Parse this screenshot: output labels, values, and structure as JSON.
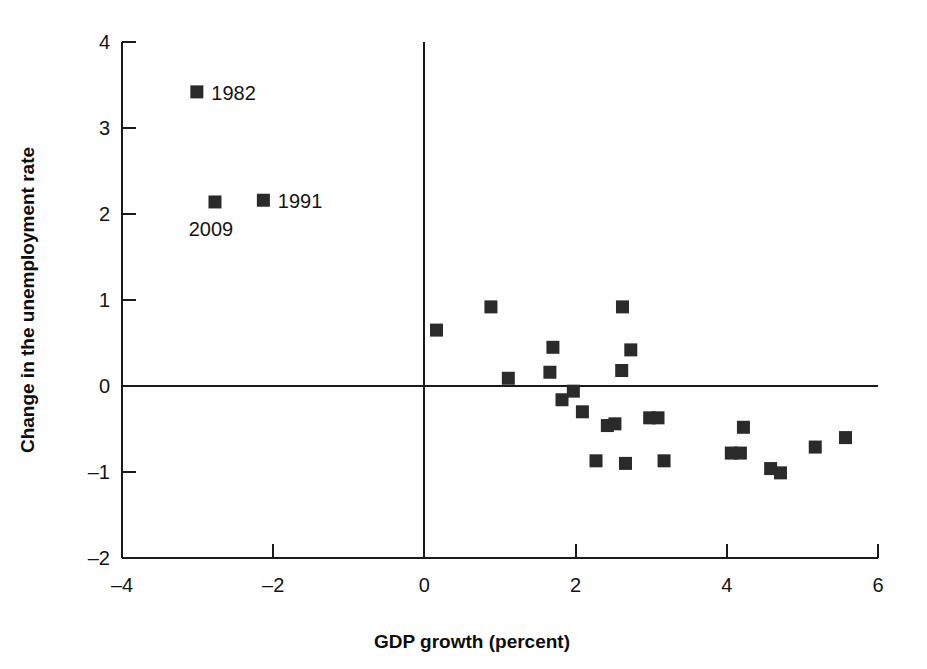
{
  "chart_data": {
    "type": "scatter",
    "title": "",
    "subtitle": "",
    "xlabel": "GDP growth (percent)",
    "ylabel": "Change in the unemployment rate",
    "xlim": [
      -4,
      6
    ],
    "ylim": [
      -2,
      4
    ],
    "xticks": [
      -4,
      -2,
      0,
      2,
      4,
      6
    ],
    "yticks": [
      -2,
      -1,
      0,
      1,
      2,
      3,
      4
    ],
    "xtick_labels": [
      "–4",
      "–2",
      "0",
      "2",
      "4",
      "6"
    ],
    "ytick_labels": [
      "–2",
      "–1",
      "0",
      "1",
      "2",
      "3",
      "4"
    ],
    "grid": false,
    "legend": "none",
    "zero_lines": {
      "x": true,
      "y": true
    },
    "marker": {
      "shape": "square",
      "color": "#2a2a2a",
      "size": 13
    },
    "annotations": [
      {
        "text": "1982",
        "x": -3.01,
        "y": 3.42,
        "placement": "right"
      },
      {
        "text": "2009",
        "x": -2.77,
        "y": 2.14,
        "placement": "below-left"
      },
      {
        "text": "1991",
        "x": -2.13,
        "y": 2.16,
        "placement": "right"
      }
    ],
    "points": [
      {
        "x": -3.01,
        "y": 3.42,
        "label": "1982"
      },
      {
        "x": -2.77,
        "y": 2.14,
        "label": "2009"
      },
      {
        "x": -2.13,
        "y": 2.16,
        "label": "1991"
      },
      {
        "x": 0.16,
        "y": 0.65,
        "label": ""
      },
      {
        "x": 0.88,
        "y": 0.92,
        "label": ""
      },
      {
        "x": 1.11,
        "y": 0.09,
        "label": ""
      },
      {
        "x": 1.7,
        "y": 0.45,
        "label": ""
      },
      {
        "x": 1.66,
        "y": 0.16,
        "label": ""
      },
      {
        "x": 1.82,
        "y": -0.16,
        "label": ""
      },
      {
        "x": 1.97,
        "y": -0.06,
        "label": ""
      },
      {
        "x": 2.09,
        "y": -0.3,
        "label": ""
      },
      {
        "x": 2.27,
        "y": -0.87,
        "label": ""
      },
      {
        "x": 2.42,
        "y": -0.46,
        "label": ""
      },
      {
        "x": 2.52,
        "y": -0.44,
        "label": ""
      },
      {
        "x": 2.62,
        "y": 0.92,
        "label": ""
      },
      {
        "x": 2.61,
        "y": 0.18,
        "label": ""
      },
      {
        "x": 2.73,
        "y": 0.42,
        "label": ""
      },
      {
        "x": 2.66,
        "y": -0.9,
        "label": ""
      },
      {
        "x": 2.98,
        "y": -0.37,
        "label": ""
      },
      {
        "x": 3.09,
        "y": -0.37,
        "label": ""
      },
      {
        "x": 3.17,
        "y": -0.87,
        "label": ""
      },
      {
        "x": 4.06,
        "y": -0.78,
        "label": ""
      },
      {
        "x": 4.18,
        "y": -0.78,
        "label": ""
      },
      {
        "x": 4.22,
        "y": -0.48,
        "label": ""
      },
      {
        "x": 4.58,
        "y": -0.96,
        "label": ""
      },
      {
        "x": 4.71,
        "y": -1.01,
        "label": ""
      },
      {
        "x": 5.17,
        "y": -0.71,
        "label": ""
      },
      {
        "x": 5.57,
        "y": -0.6,
        "label": ""
      }
    ]
  },
  "axes": {
    "x_title": "GDP growth (percent)",
    "y_title": "Change in the unemployment rate"
  }
}
